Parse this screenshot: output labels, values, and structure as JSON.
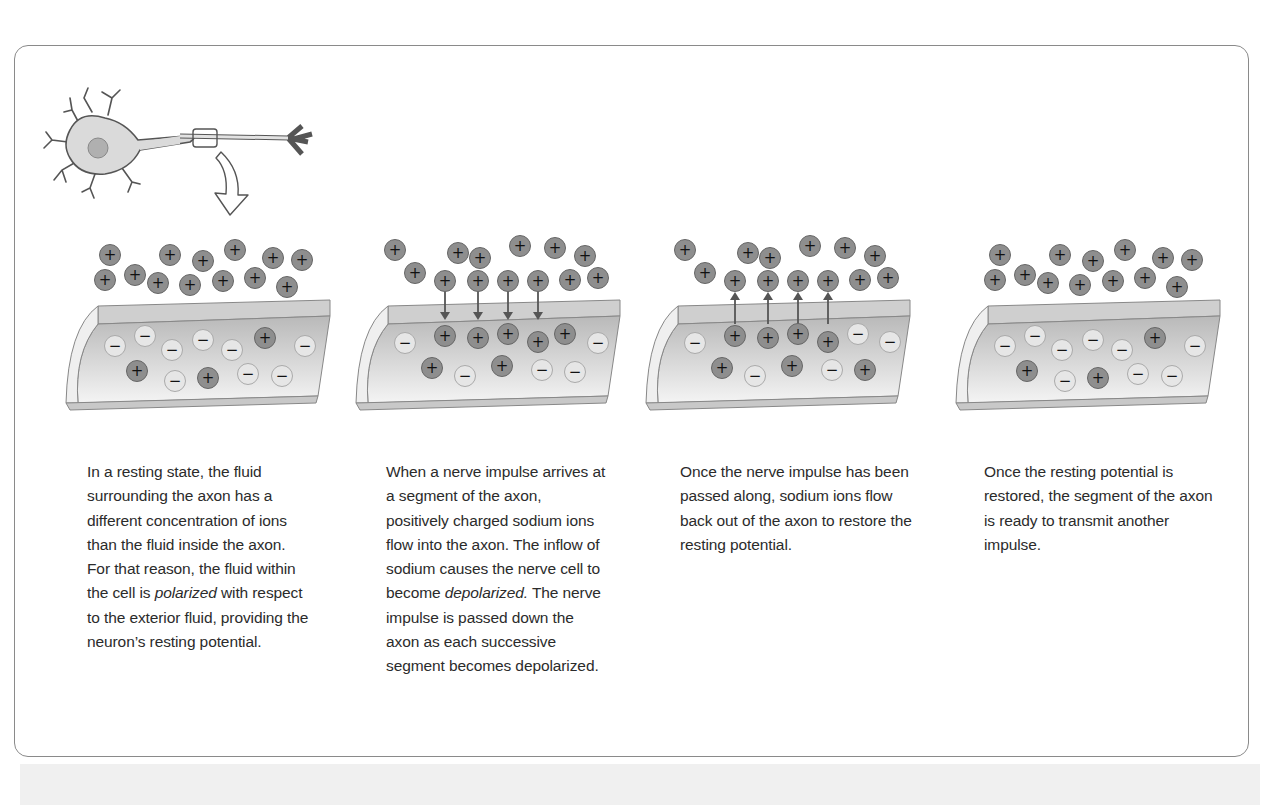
{
  "figure": {
    "colors": {
      "border": "#8a8a8a",
      "positive_ion": "#8e8e8e",
      "negative_ion": "#e6e6e6",
      "membrane": "#cfcfcf",
      "text": "#2b2b2b"
    },
    "neuron_icon": "neuron-with-zoom-box-and-arrow",
    "panels": [
      {
        "id": "resting",
        "arrows": "none",
        "caption_parts": [
          "In a resting state, the fluid surrounding the axon has a different concentration of ions than the fluid inside the axon. For that reason, the fluid within the cell is ",
          "polarized",
          " with respect to the exterior fluid, providing the neuron’s resting potential."
        ]
      },
      {
        "id": "depolarization",
        "arrows": "inward",
        "caption_parts": [
          "When a nerve impulse arrives at a segment of the axon, positively charged sodium ions flow into the axon. The inflow of sodium causes the nerve cell to become ",
          "depolarized.",
          " The nerve impulse is passed down the axon as each successive segment becomes depolarized."
        ]
      },
      {
        "id": "repolarization",
        "arrows": "outward",
        "caption_parts": [
          "Once the nerve impulse has been passed along, sodium ions flow back out of the axon to restore the resting potential.",
          "",
          ""
        ]
      },
      {
        "id": "restored",
        "arrows": "none",
        "caption_parts": [
          "Once the resting potential is restored, the segment of the axon is ready to transmit another impulse.",
          "",
          ""
        ]
      }
    ],
    "ion_symbols": {
      "positive": "+",
      "negative": "−"
    }
  }
}
